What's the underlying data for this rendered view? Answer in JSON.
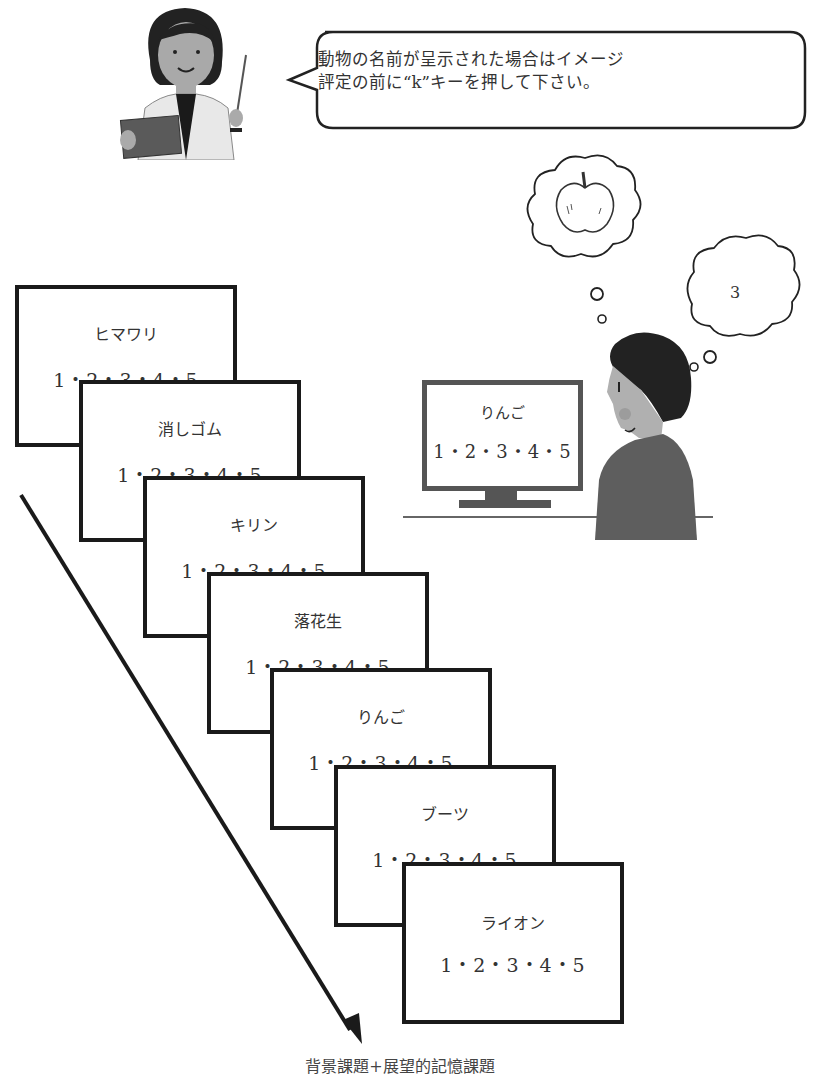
{
  "instruction_bubble": {
    "line1": "動物の名前が呈示された場合はイメージ",
    "line2": "評定の前に“k”キーを押して下さい。"
  },
  "participant": {
    "monitor": {
      "word": "りんご",
      "scale": "1・2・3・4・5"
    },
    "thought_image": "apple-icon",
    "thought_rating": "3"
  },
  "trial_cards": [
    {
      "word": "ヒマワリ",
      "scale": "1・2・3・4・5"
    },
    {
      "word": "消しゴム",
      "scale": "1・2・3・4・5"
    },
    {
      "word": "キリン",
      "scale": "1・2・3・4・5"
    },
    {
      "word": "落花生",
      "scale": "1・2・3・4・5"
    },
    {
      "word": "りんご",
      "scale": "1・2・3・4・5"
    },
    {
      "word": "ブーツ",
      "scale": "1・2・3・4・5"
    },
    {
      "word": "ライオン",
      "scale": "1・2・3・4・5"
    }
  ],
  "caption": "背景課題+展望的記憶課題",
  "colors": {
    "line": "#1a1a1a",
    "text": "#333333",
    "figure_gray": "#6b6b6b"
  }
}
